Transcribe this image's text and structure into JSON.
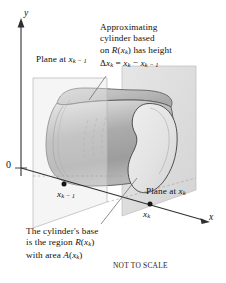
{
  "figure": {
    "caption": "NOT TO SCALE",
    "background": "#ffffff",
    "ink_color": "#111111"
  },
  "axes": {
    "y_label": "y",
    "x_label": "x",
    "origin_label": "0"
  },
  "annotations": {
    "approximating": {
      "line1": "Approximating",
      "line2": "cylinder based",
      "line3_pre": "on ",
      "line3_fn": "R",
      "line3_arg_open": "(",
      "line3_var": "x",
      "line3_sub": "k",
      "line3_arg_close": ")",
      "line3_post": " has height",
      "line4_delta": "Δ",
      "line4_x": "x",
      "line4_sub": "k",
      "line4_eq": " = ",
      "line4_x2": "x",
      "line4_sub2": "k",
      "line4_minus": " − ",
      "line4_x3": "x",
      "line4_sub3": "k − 1"
    },
    "plane_left": {
      "text": "Plane at ",
      "var": "x",
      "sub": "k − 1"
    },
    "plane_right": {
      "text": "Plane at ",
      "var": "x",
      "sub": "k"
    },
    "base": {
      "line1": "The cylinder's base",
      "line2_pre": "is the region ",
      "line2_fn": "R",
      "line2_open": "(",
      "line2_var": "x",
      "line2_sub": "k",
      "line2_close": ")",
      "line3_pre": "with area ",
      "line3_fn": "A",
      "line3_open": "(",
      "line3_var": "x",
      "line3_sub": "k",
      "line3_close": ")"
    },
    "point_left": {
      "var": "x",
      "sub": "k − 1"
    },
    "point_right": {
      "var": "x",
      "sub": "k"
    }
  },
  "colors": {
    "plane_fill": "#e3e3e3",
    "plane_stroke": "#b7b7b7",
    "cylinder_light": "#f1f1f1",
    "cylinder_mid": "#bdbdbd",
    "cylinder_dark": "#9a9a9a",
    "outline": "#4a4a4a",
    "axis": "#2a2a2a",
    "leader": "#6d6d6d"
  }
}
